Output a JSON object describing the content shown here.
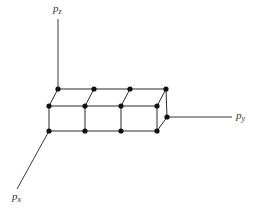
{
  "diagram": {
    "type": "3d-lattice",
    "axes": {
      "z": {
        "base": "p",
        "sub": "z"
      },
      "y": {
        "base": "p",
        "sub": "y"
      },
      "x": {
        "base": "p",
        "sub": "x"
      }
    },
    "colors": {
      "line": "#2a2a2a",
      "node": "#111111",
      "label": "#333333",
      "background": "#ffffff"
    },
    "node_count": 14
  }
}
